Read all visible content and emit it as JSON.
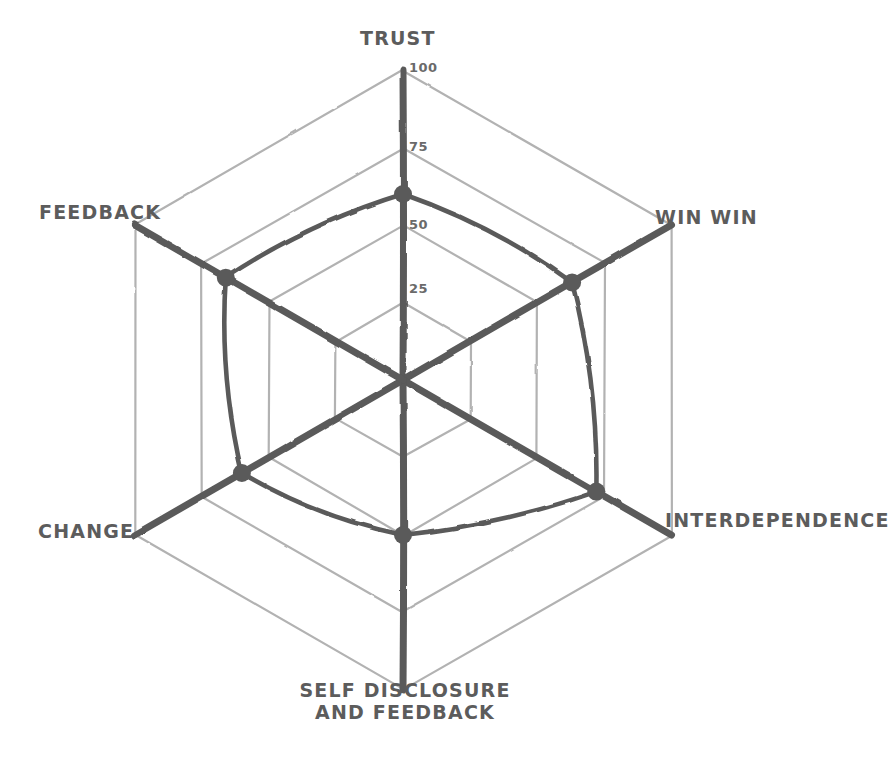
{
  "chart_data": {
    "type": "radar",
    "title": "",
    "categories": [
      "TRUST",
      "WIN WIN",
      "INTERDEPENDENCE",
      "SELF DISCLOSURE AND FEEDBACK",
      "CHANGE",
      "FEEDBACK"
    ],
    "values": [
      60,
      63,
      72,
      50,
      60,
      66
    ],
    "series": [
      {
        "name": "",
        "values": [
          60,
          63,
          72,
          50,
          60,
          66
        ]
      }
    ],
    "tick_labels": [
      "25",
      "50",
      "75",
      "100"
    ],
    "tick_values": [
      25,
      50,
      75,
      100
    ],
    "rlim": [
      0,
      100
    ],
    "grid": true,
    "legend": false,
    "legend_position": "none",
    "xlabel": "",
    "ylabel": "",
    "style": "hand-drawn",
    "colors": {
      "data_line": "#5a5a5a",
      "axis_line": "#5a5a5a",
      "grid_ring": "#b2b2b2",
      "label_text": "#5c5c5c",
      "tick_text": "#6a6a6a",
      "background": "#ffffff"
    }
  },
  "axis_labels": [
    {
      "text": "TRUST",
      "lines": [
        "TRUST"
      ]
    },
    {
      "text": "WIN WIN",
      "lines": [
        "WIN WIN"
      ]
    },
    {
      "text": "INTERDEPENDENCE",
      "lines": [
        "INTERDEPENDENCE"
      ]
    },
    {
      "text": "SELF DISCLOSURE AND FEEDBACK",
      "lines": [
        "SELF DISCLOSURE",
        "AND FEEDBACK"
      ]
    },
    {
      "text": "CHANGE",
      "lines": [
        "CHANGE"
      ]
    },
    {
      "text": "FEEDBACK",
      "lines": [
        "FEEDBACK"
      ]
    }
  ],
  "tick_labels": {
    "t100": "100",
    "t75": "75",
    "t50": "50",
    "t25": "25"
  },
  "self_disclosure_label": {
    "line1": "SELF DISCLOSURE",
    "line2": "AND FEEDBACK"
  }
}
